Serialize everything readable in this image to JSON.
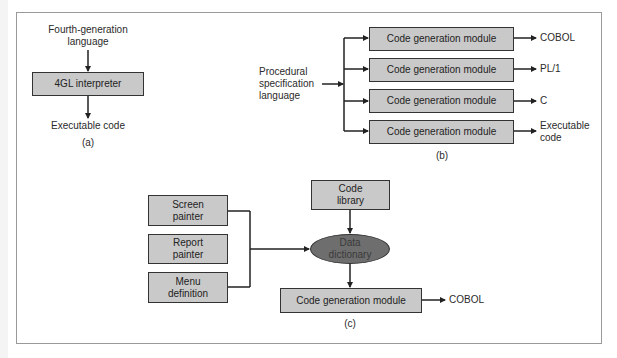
{
  "diagram_a": {
    "input_label": "Fourth-generation\nlanguage",
    "input_line1": "Fourth-generation",
    "input_line2": "language",
    "process_box": "4GL interpreter",
    "output_label": "Executable code",
    "caption": "(a)"
  },
  "diagram_b": {
    "input_line1": "Procedural",
    "input_line2": "specification",
    "input_line3": "language",
    "modules": [
      {
        "label": "Code generation module",
        "output": "COBOL"
      },
      {
        "label": "Code generation module",
        "output": "PL/1"
      },
      {
        "label": "Code generation module",
        "output": "C"
      },
      {
        "label": "Code generation module",
        "output_line1": "Executable",
        "output_line2": "code"
      }
    ],
    "caption": "(b)"
  },
  "diagram_c": {
    "inputs": [
      {
        "line1": "Screen",
        "line2": "painter"
      },
      {
        "line1": "Report",
        "line2": "painter"
      },
      {
        "line1": "Menu",
        "line2": "definition"
      }
    ],
    "library": {
      "line1": "Code",
      "line2": "library"
    },
    "dictionary": {
      "line1": "Data",
      "line2": "dictionary"
    },
    "module": "Code generation module",
    "output": "COBOL",
    "caption": "(c)"
  },
  "colors": {
    "box_fill": "#c9c9c9",
    "ellipse_fill": "#6e6e6e",
    "line": "#222222",
    "frame": "#9a9a9a"
  }
}
